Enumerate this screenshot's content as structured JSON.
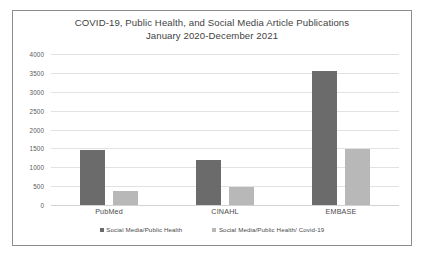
{
  "chart_data": {
    "type": "bar",
    "title": "COVID-19, Public Health, and Social Media Article Publications January 2020-December 2021",
    "title_lines": [
      "COVID-19, Public Health, and Social Media Article Publications",
      "January 2020-December 2021"
    ],
    "categories": [
      "PubMed",
      "CINAHL",
      "EMBASE"
    ],
    "series": [
      {
        "name": "Social Media/Public Health",
        "color": "#6b6b6b",
        "values": [
          1450,
          1200,
          3550
        ]
      },
      {
        "name": "Social Media/Public Health/ Covid-19",
        "color": "#b8b8b8",
        "values": [
          370,
          480,
          1480
        ]
      }
    ],
    "xlabel": "",
    "ylabel": "",
    "ylim": [
      0,
      4000
    ],
    "yticks": [
      0,
      500,
      1000,
      1500,
      2000,
      2500,
      3000,
      3500,
      4000
    ],
    "ytick_labels": [
      "0",
      "500",
      "1000",
      "1500",
      "2000",
      "2500",
      "3000",
      "3500",
      "4000"
    ],
    "grid": "horizontal",
    "legend_position": "bottom-center",
    "border_color": "#8c8c8c",
    "gridline_color": "#e2e2e2",
    "background": "#ffffff"
  }
}
